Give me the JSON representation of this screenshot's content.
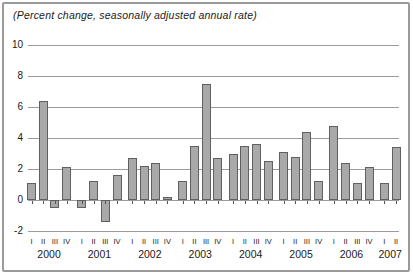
{
  "chart_data": {
    "type": "bar",
    "title": "(Percent change, seasonally adjusted annual rate)",
    "xlabel": "",
    "ylabel": "",
    "ylim": [
      -2,
      10
    ],
    "yticks": [
      10,
      8,
      6,
      4,
      2,
      0,
      -2
    ],
    "grid": true,
    "legend": "none",
    "groups": [
      {
        "year": "2000",
        "quarters": [
          "I",
          "II",
          "III",
          "IV"
        ],
        "values": [
          1.1,
          6.4,
          -0.5,
          2.1
        ]
      },
      {
        "year": "2001",
        "quarters": [
          "I",
          "II",
          "III",
          "IV"
        ],
        "values": [
          -0.5,
          1.2,
          -1.4,
          1.6
        ]
      },
      {
        "year": "2002",
        "quarters": [
          "I",
          "II",
          "III",
          "IV"
        ],
        "values": [
          2.7,
          2.2,
          2.4,
          0.2
        ]
      },
      {
        "year": "2003",
        "quarters": [
          "I",
          "II",
          "III",
          "IV"
        ],
        "values": [
          1.2,
          3.5,
          7.5,
          2.7
        ]
      },
      {
        "year": "2004",
        "quarters": [
          "I",
          "II",
          "III",
          "IV"
        ],
        "values": [
          3.0,
          3.5,
          3.6,
          2.5
        ]
      },
      {
        "year": "2005",
        "quarters": [
          "I",
          "II",
          "III",
          "IV"
        ],
        "values": [
          3.1,
          2.8,
          4.4,
          1.2
        ]
      },
      {
        "year": "2006",
        "quarters": [
          "I",
          "II",
          "III",
          "IV"
        ],
        "values": [
          4.8,
          2.4,
          1.1,
          2.1
        ]
      },
      {
        "year": "2007",
        "quarters": [
          "I",
          "II"
        ],
        "values": [
          1.1,
          3.4
        ]
      }
    ],
    "colors": {
      "bar_fill": "#a9a9a9",
      "bar_border": "#606060",
      "gridline": "#9b9b9b",
      "frame_border": "#9a9a9a",
      "text": "#1a1a1a",
      "background": "#ffffff"
    }
  }
}
